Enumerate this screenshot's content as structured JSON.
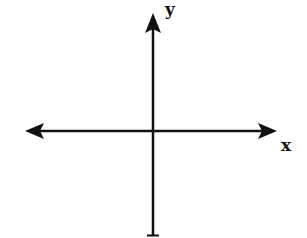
{
  "diagram": {
    "type": "coordinate-axes",
    "labels": {
      "x_axis": "x",
      "y_axis": "y"
    },
    "colors": {
      "background": "#ffffff",
      "stroke": "#111111"
    },
    "elements": [
      {
        "name": "x-axis",
        "description": "horizontal line with arrowheads at both ends"
      },
      {
        "name": "y-axis",
        "description": "vertical line with arrowhead at top, flat tick at bottom"
      }
    ]
  }
}
